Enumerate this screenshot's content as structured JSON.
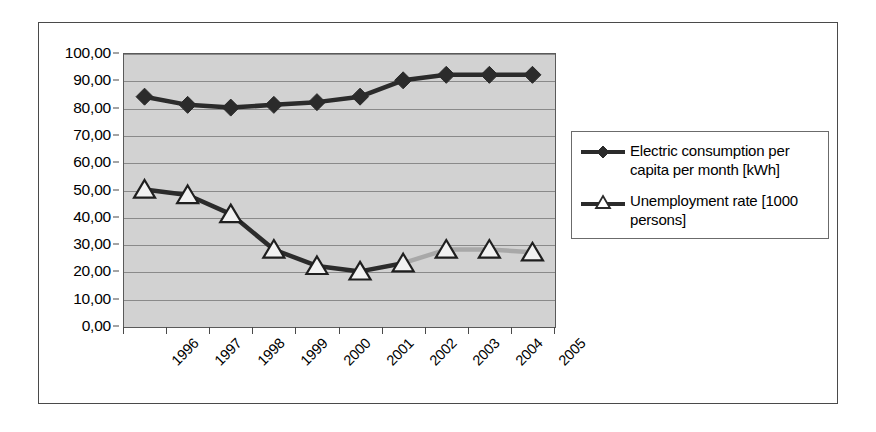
{
  "chart_data": {
    "type": "line",
    "title": "",
    "xlabel": "",
    "ylabel": "",
    "categories": [
      "1996",
      "1997",
      "1998",
      "1999",
      "2000",
      "2001",
      "2002",
      "2003",
      "2004",
      "2005"
    ],
    "ylim": [
      0,
      100
    ],
    "ytick_labels": [
      "0,00",
      "10,00",
      "20,00",
      "30,00",
      "40,00",
      "50,00",
      "60,00",
      "70,00",
      "80,00",
      "90,00",
      "100,00"
    ],
    "ytick_values": [
      0,
      10,
      20,
      30,
      40,
      50,
      60,
      70,
      80,
      90,
      100
    ],
    "grid": true,
    "legend_position": "right",
    "plot_background": "#d2d2d2",
    "gridline_color": "#8a8a8a",
    "series": [
      {
        "name": "Electric consumption per capita per month [kWh]",
        "marker": "filled-diamond",
        "color": "#2b2b2b",
        "values": [
          84,
          81,
          80,
          81,
          82,
          84,
          90,
          92,
          92,
          92
        ]
      },
      {
        "name": "Unemployment rate [1000 persons]",
        "marker": "hollow-triangle",
        "color": "#2b2b2b",
        "late_segment_color": "#a8a8a8",
        "values": [
          50,
          48,
          41,
          28,
          22,
          20,
          23,
          28,
          28,
          27
        ]
      }
    ]
  },
  "legend": {
    "entries": [
      {
        "label": "Electric consumption per capita per month [kWh]",
        "marker": "filled-diamond"
      },
      {
        "label": "Unemployment rate [1000 persons]",
        "marker": "hollow-triangle"
      }
    ]
  }
}
